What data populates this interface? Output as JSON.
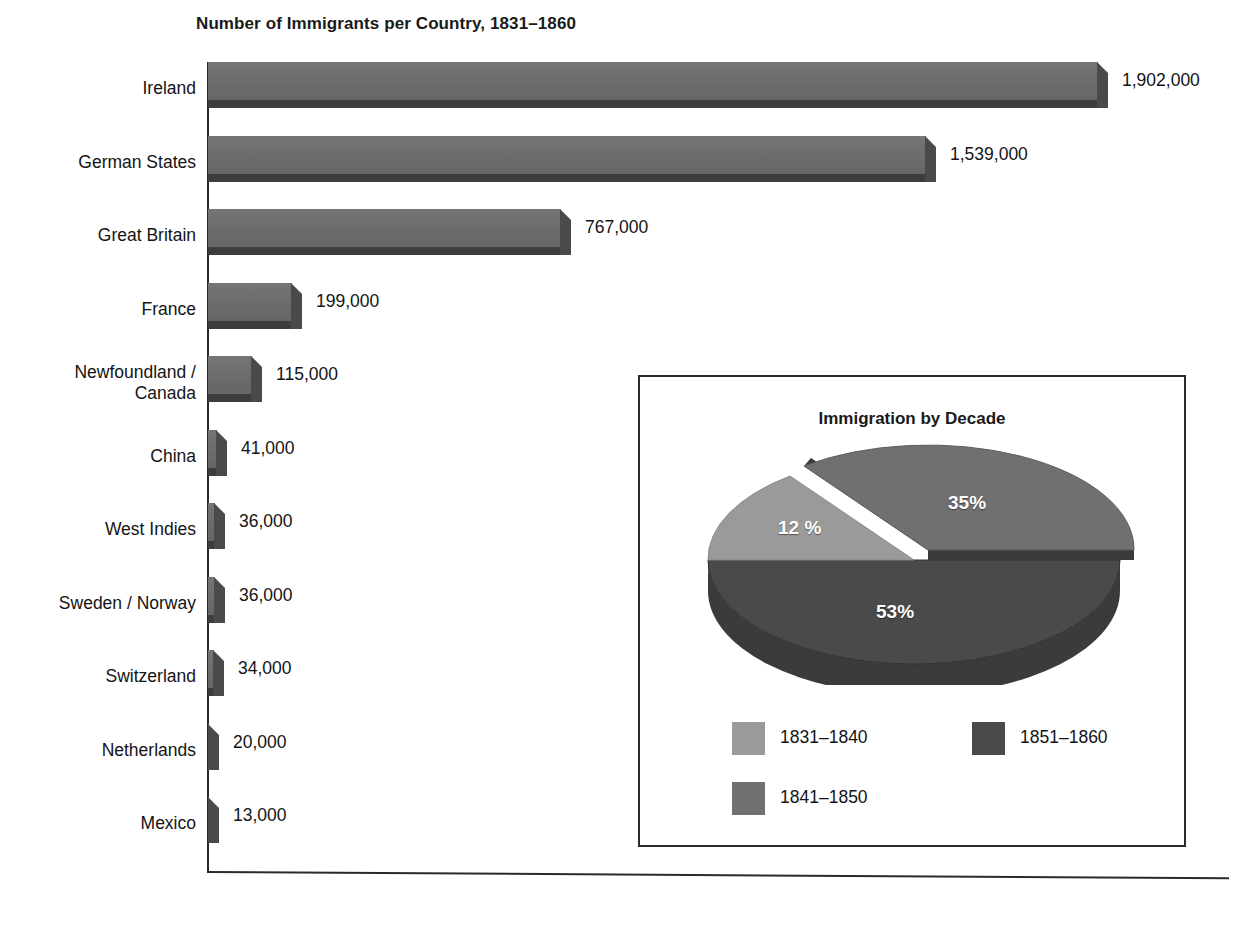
{
  "chart_data": [
    {
      "type": "bar",
      "orientation": "horizontal",
      "title": "Number of Immigrants per Country, 1831–1860",
      "xlabel": "",
      "ylabel": "",
      "grid": false,
      "xlim": [
        0,
        1902000
      ],
      "categories": [
        "Ireland",
        "German States",
        "Great Britain",
        "France",
        "Newfoundland / Canada",
        "China",
        "West Indies",
        "Sweden / Norway",
        "Switzerland",
        "Netherlands",
        "Mexico"
      ],
      "values": [
        1902000,
        1539000,
        767000,
        199000,
        115000,
        41000,
        36000,
        36000,
        34000,
        20000,
        13000
      ],
      "value_labels": [
        "1,902,000",
        "1,539,000",
        "767,000",
        "199,000",
        "115,000",
        "41,000",
        "36,000",
        "36,000",
        "34,000",
        "20,000",
        "13,000"
      ],
      "bar_color": "#6e6e6e",
      "bar_shadow_color": "#3d3d3d"
    },
    {
      "type": "pie",
      "title": "Immigration by Decade",
      "labels": [
        "1831–1840",
        "1841–1850",
        "1851–1860"
      ],
      "values": [
        12,
        35,
        53
      ],
      "data_labels": [
        "12 %",
        "35%",
        "53%"
      ],
      "colors": [
        "#9a9a9a",
        "#707070",
        "#4a4a4a"
      ],
      "exploded": [
        "1841–1850"
      ],
      "legend_position": "bottom"
    }
  ],
  "bar_chart": {
    "title": "Number of Immigrants per Country, 1831–1860",
    "rows": [
      {
        "label_line1": "Ireland",
        "label_line2": "",
        "value": "1,902,000"
      },
      {
        "label_line1": "German States",
        "label_line2": "",
        "value": "1,539,000"
      },
      {
        "label_line1": "Great Britain",
        "label_line2": "",
        "value": "767,000"
      },
      {
        "label_line1": "France",
        "label_line2": "",
        "value": "199,000"
      },
      {
        "label_line1": "Newfoundland /",
        "label_line2": "Canada",
        "value": "115,000"
      },
      {
        "label_line1": "China",
        "label_line2": "",
        "value": "41,000"
      },
      {
        "label_line1": "West Indies",
        "label_line2": "",
        "value": "36,000"
      },
      {
        "label_line1": "Sweden / Norway",
        "label_line2": "",
        "value": "36,000"
      },
      {
        "label_line1": "Switzerland",
        "label_line2": "",
        "value": "34,000"
      },
      {
        "label_line1": "Netherlands",
        "label_line2": "",
        "value": "20,000"
      },
      {
        "label_line1": "Mexico",
        "label_line2": "",
        "value": "13,000"
      }
    ]
  },
  "pie_chart": {
    "title": "Immigration by Decade",
    "slices": [
      {
        "label": "12 %",
        "name": "1831–1840",
        "percent": 12,
        "color": "#9a9a9a"
      },
      {
        "label": "35%",
        "name": "1841–1850",
        "percent": 35,
        "color": "#707070"
      },
      {
        "label": "53%",
        "name": "1851–1860",
        "percent": 53,
        "color": "#4a4a4a"
      }
    ],
    "legend": [
      {
        "label": "1831–1840",
        "color": "#9a9a9a"
      },
      {
        "label": "1851–1860",
        "color": "#4a4a4a"
      },
      {
        "label": "1841–1850",
        "color": "#707070"
      }
    ]
  }
}
